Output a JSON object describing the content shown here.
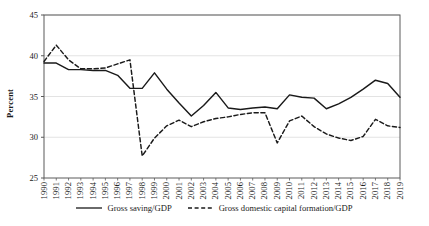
{
  "chart_data": {
    "type": "line",
    "title": "",
    "xlabel": "",
    "ylabel": "Percent",
    "ylim": [
      25,
      45
    ],
    "yticks": [
      25,
      30,
      35,
      40,
      45
    ],
    "grid": "horizontal",
    "legend_position": "bottom",
    "categories": [
      "1990",
      "1991",
      "1992",
      "1993",
      "1994",
      "1995",
      "1996",
      "1997",
      "1998",
      "1999",
      "2000",
      "2001",
      "2002",
      "2003",
      "2004",
      "2005",
      "2006",
      "2007",
      "2008",
      "2009",
      "2010",
      "2011",
      "2012",
      "2013",
      "2014",
      "2015",
      "2016",
      "2017",
      "2018",
      "2019"
    ],
    "series": [
      {
        "name": "Gross saving/GDP",
        "style": "solid",
        "color": "#1a1a1a",
        "values": [
          39.1,
          39.1,
          38.3,
          38.3,
          38.2,
          38.2,
          37.6,
          36.0,
          36.0,
          37.9,
          35.9,
          34.2,
          32.6,
          33.9,
          35.5,
          33.6,
          33.4,
          33.6,
          33.7,
          33.5,
          35.2,
          34.9,
          34.8,
          33.5,
          34.1,
          34.9,
          35.9,
          37.0,
          36.6,
          34.9
        ]
      },
      {
        "name": "Gross domestic capital formation/GDP",
        "style": "dashed",
        "color": "#1a1a1a",
        "values": [
          39.3,
          41.3,
          39.5,
          38.4,
          38.4,
          38.5,
          39.0,
          39.5,
          27.7,
          29.9,
          31.4,
          32.1,
          31.3,
          31.9,
          32.3,
          32.5,
          32.8,
          33.0,
          33.0,
          29.3,
          32.0,
          32.6,
          31.3,
          30.4,
          29.9,
          29.6,
          30.1,
          32.2,
          31.4,
          31.2
        ]
      }
    ]
  },
  "axes": {
    "y_tick_labels": [
      "45",
      "40",
      "35",
      "30",
      "25"
    ],
    "y_axis_title": "Percent",
    "x_tick_labels": [
      "1990",
      "1991",
      "1992",
      "1993",
      "1994",
      "1995",
      "1996",
      "1997",
      "1998",
      "1999",
      "2000",
      "2001",
      "2002",
      "2003",
      "2004",
      "2005",
      "2006",
      "2007",
      "2008",
      "2009",
      "2010",
      "2011",
      "2012",
      "2013",
      "2014",
      "2015",
      "2016",
      "2017",
      "2018",
      "2019"
    ]
  },
  "legend": {
    "items": [
      {
        "label": "Gross saving/GDP",
        "style": "solid"
      },
      {
        "label": "Gross domestic capital formation/GDP",
        "style": "dashed"
      }
    ]
  },
  "colors": {
    "line": "#1a1a1a",
    "grid": "#e3e3e3",
    "frame": "#5a5a5a",
    "background": "#ffffff"
  }
}
